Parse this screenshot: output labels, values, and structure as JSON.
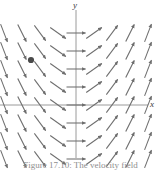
{
  "figure": {
    "caption": "Figure 17.10: The velocity field",
    "axis_labels": {
      "x": "x",
      "y": "y"
    },
    "colors": {
      "arrow": "#6e6e6e",
      "axis": "#9a9a9a",
      "point": "#4a4a4a",
      "caption": "#8e8e8e",
      "background": "#ffffff"
    }
  },
  "chart_data": {
    "type": "scatter",
    "title": "",
    "subtitle": "",
    "xlabel": "x",
    "ylabel": "y",
    "legend": [],
    "grid": false,
    "plot_kind": "slope-field",
    "xlim": [
      -4.5,
      4.5
    ],
    "ylim": [
      -4.5,
      4.5
    ],
    "axis_origin_px": [
      76,
      105
    ],
    "px_per_unit": 18,
    "arrow_length_px": 19,
    "slope_rule": "dy/dx proportional to x",
    "grid_x_units": [
      -4,
      -3,
      -2,
      -1,
      0,
      1,
      2,
      3,
      4
    ],
    "grid_y_units": [
      -4,
      -3,
      -2,
      -1,
      0,
      1,
      2,
      3,
      4
    ],
    "slope_by_x_unit": {
      "-4": -2.6,
      "-3": -2.0,
      "-2": -1.35,
      "-1": -0.7,
      "0": 0,
      "1": 0.7,
      "2": 1.35,
      "3": 2.0,
      "4": 2.6
    },
    "annotations": [
      {
        "name": "marked-point",
        "label": "",
        "x": -2.5,
        "y": 2.5,
        "px": [
          31,
          60
        ],
        "radius_px": 3.1,
        "color": "#4a4a4a"
      }
    ],
    "axes": [
      {
        "name": "x-axis",
        "from_px": [
          0,
          105
        ],
        "to_px": [
          148,
          105
        ]
      },
      {
        "name": "y-axis",
        "from_px": [
          76,
          10
        ],
        "to_px": [
          76,
          158
        ]
      }
    ]
  }
}
